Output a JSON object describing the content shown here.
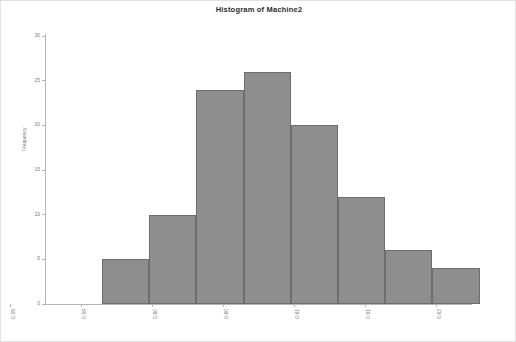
{
  "chart_data": {
    "type": "bar",
    "title": "Histogram of Machine2",
    "xlabel": "",
    "ylabel": "Frequency",
    "ylim": [
      0,
      30
    ],
    "yticks": [
      0,
      5,
      10,
      15,
      20,
      25,
      30
    ],
    "xlim": [
      0.59,
      0.62
    ],
    "xtick_labels": [
      "0.59",
      "0.59",
      "0.60",
      "0.60",
      "0.61",
      "0.61",
      "0.62"
    ],
    "xtick_values": [
      0.5875,
      0.5925,
      0.5975,
      0.6025,
      0.6075,
      0.6125,
      0.6175
    ],
    "grid": false,
    "legend": false,
    "bar_color": "#8e8e8e",
    "bar_edge_color": "#6d6d6d",
    "categories": [
      "0.5935",
      "0.5968",
      "0.6000",
      "0.6032",
      "0.6065",
      "0.6097",
      "0.6129",
      "0.6161"
    ],
    "values": [
      5,
      10,
      24,
      26,
      20,
      12,
      6,
      4
    ],
    "bins": [
      {
        "left": 0.5919,
        "right": 0.5952,
        "frequency": 5
      },
      {
        "left": 0.5952,
        "right": 0.5984,
        "frequency": 10
      },
      {
        "left": 0.5984,
        "right": 0.6016,
        "frequency": 24
      },
      {
        "left": 0.6016,
        "right": 0.6048,
        "frequency": 26
      },
      {
        "left": 0.6048,
        "right": 0.6081,
        "frequency": 20
      },
      {
        "left": 0.6081,
        "right": 0.6113,
        "frequency": 12
      },
      {
        "left": 0.6113,
        "right": 0.6145,
        "frequency": 6
      },
      {
        "left": 0.6145,
        "right": 0.6177,
        "frequency": 4
      }
    ]
  }
}
